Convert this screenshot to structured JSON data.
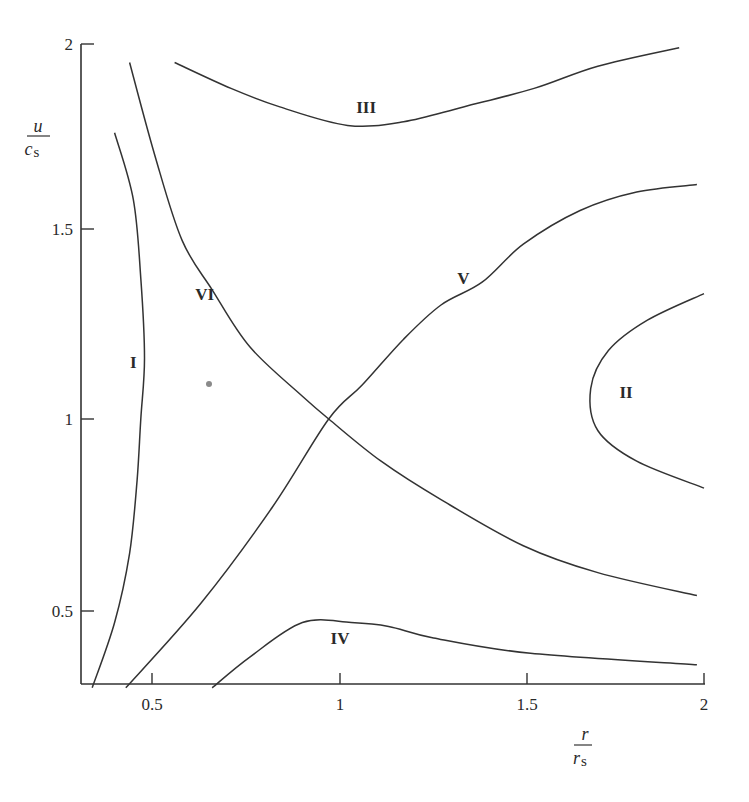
{
  "chart_data": {
    "type": "line",
    "title": "",
    "xlabel": "r / r_s",
    "ylabel": "u / c_s",
    "xlabel_parts": {
      "numerator": "r",
      "denominator": "r",
      "denominator_sub": "s"
    },
    "ylabel_parts": {
      "numerator": "u",
      "denominator": "c",
      "denominator_sub": "s"
    },
    "xlim": [
      0.31,
      2.0
    ],
    "ylim": [
      0.31,
      2.0
    ],
    "xticks": [
      0.5,
      1,
      1.5,
      2
    ],
    "yticks": [
      0.5,
      1,
      1.5,
      2
    ],
    "xtick_labels": [
      "0.5",
      "1",
      "1.5",
      "2"
    ],
    "ytick_labels": [
      "0.5",
      "1",
      "1.5",
      "2"
    ],
    "grid": false,
    "legend": "none (curves labeled inline)",
    "critical_point": {
      "r": 0.97,
      "u": 1.0
    },
    "series": [
      {
        "name": "I",
        "label_pos": {
          "r": 0.45,
          "u": 1.15
        },
        "points": [
          [
            0.4,
            1.76
          ],
          [
            0.45,
            1.58
          ],
          [
            0.47,
            1.37
          ],
          [
            0.48,
            1.16
          ],
          [
            0.47,
            1.0
          ],
          [
            0.46,
            0.84
          ],
          [
            0.44,
            0.65
          ],
          [
            0.4,
            0.47
          ],
          [
            0.34,
            0.3
          ]
        ]
      },
      {
        "name": "II",
        "label_pos": {
          "r": 1.78,
          "u": 1.07
        },
        "points": [
          [
            2.0,
            1.33
          ],
          [
            1.84,
            1.26
          ],
          [
            1.73,
            1.18
          ],
          [
            1.68,
            1.08
          ],
          [
            1.7,
            0.97
          ],
          [
            1.81,
            0.89
          ],
          [
            2.0,
            0.82
          ]
        ]
      },
      {
        "name": "III",
        "label_pos": {
          "r": 1.07,
          "u": 1.83
        },
        "points": [
          [
            0.56,
            1.95
          ],
          [
            0.71,
            1.88
          ],
          [
            0.84,
            1.83
          ],
          [
            1.02,
            1.78
          ],
          [
            1.17,
            1.79
          ],
          [
            1.33,
            1.83
          ],
          [
            1.52,
            1.88
          ],
          [
            1.7,
            1.94
          ],
          [
            1.93,
            1.99
          ]
        ]
      },
      {
        "name": "IV",
        "label_pos": {
          "r": 1.0,
          "u": 0.43
        },
        "points": [
          [
            0.66,
            0.3
          ],
          [
            0.76,
            0.38
          ],
          [
            0.9,
            0.47
          ],
          [
            1.03,
            0.47
          ],
          [
            1.13,
            0.46
          ],
          [
            1.25,
            0.43
          ],
          [
            1.51,
            0.39
          ],
          [
            1.98,
            0.36
          ]
        ]
      },
      {
        "name": "V",
        "label_pos": {
          "r": 1.33,
          "u": 1.37
        },
        "points": [
          [
            0.43,
            0.3
          ],
          [
            0.63,
            0.52
          ],
          [
            0.82,
            0.77
          ],
          [
            0.97,
            1.0
          ],
          [
            1.06,
            1.09
          ],
          [
            1.17,
            1.21
          ],
          [
            1.27,
            1.3
          ],
          [
            1.38,
            1.36
          ],
          [
            1.49,
            1.46
          ],
          [
            1.65,
            1.55
          ],
          [
            1.81,
            1.6
          ],
          [
            1.98,
            1.62
          ]
        ]
      },
      {
        "name": "VI",
        "label_pos": {
          "r": 0.64,
          "u": 1.33
        },
        "points": [
          [
            0.44,
            1.95
          ],
          [
            0.51,
            1.69
          ],
          [
            0.58,
            1.47
          ],
          [
            0.66,
            1.34
          ],
          [
            0.76,
            1.19
          ],
          [
            0.9,
            1.06
          ],
          [
            0.97,
            1.0
          ],
          [
            1.11,
            0.89
          ],
          [
            1.27,
            0.79
          ],
          [
            1.49,
            0.67
          ],
          [
            1.7,
            0.6
          ],
          [
            1.98,
            0.54
          ]
        ]
      }
    ]
  },
  "colors": {
    "line": "#333333",
    "text": "#2a2a2a",
    "background": "#ffffff"
  }
}
